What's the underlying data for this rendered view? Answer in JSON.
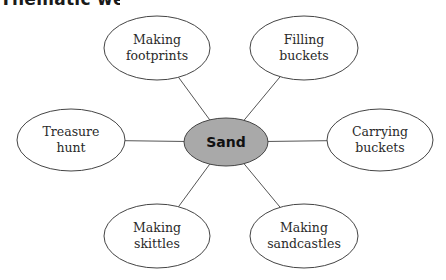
{
  "heading": "Thematic web",
  "colors": {
    "center_fill": "#a9a9a9",
    "node_fill": "#ffffff",
    "stroke": "#444444",
    "line": "#555555"
  },
  "center": {
    "label": "Sand",
    "cx": 226,
    "cy": 142,
    "rx": 42,
    "ry": 24
  },
  "nodes": [
    {
      "id": "making-footprints",
      "lines": [
        "Making",
        "footprints"
      ],
      "cx": 157,
      "cy": 48,
      "rx": 53,
      "ry": 32
    },
    {
      "id": "filling-buckets",
      "lines": [
        "Filling",
        "buckets"
      ],
      "cx": 304,
      "cy": 48,
      "rx": 54,
      "ry": 32
    },
    {
      "id": "treasure-hunt",
      "lines": [
        "Treasure",
        "hunt"
      ],
      "cx": 71,
      "cy": 140,
      "rx": 54,
      "ry": 31
    },
    {
      "id": "carrying-buckets",
      "lines": [
        "Carrying",
        "buckets"
      ],
      "cx": 380,
      "cy": 140,
      "rx": 53,
      "ry": 31
    },
    {
      "id": "making-skittles",
      "lines": [
        "Making",
        "skittles"
      ],
      "cx": 157,
      "cy": 236,
      "rx": 53,
      "ry": 32
    },
    {
      "id": "making-sandcastles",
      "lines": [
        "Making",
        "sandcastles"
      ],
      "cx": 304,
      "cy": 236,
      "rx": 54,
      "ry": 32
    }
  ]
}
